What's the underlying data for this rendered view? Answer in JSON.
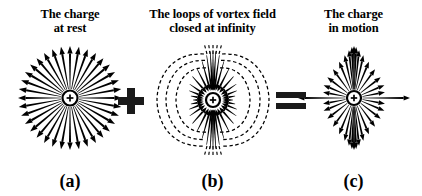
{
  "figure": {
    "background": "#ffffff",
    "ink": "#000000",
    "caption_equation": "(a) + (b) = (c)"
  },
  "panels": [
    {
      "id": "a",
      "label": "(a)",
      "title_line1": "The charge",
      "title_line2": "at rest",
      "charge_symbol": "+",
      "field": {
        "type": "radial-arrows",
        "ray_count": 36,
        "inner_radius": 9,
        "outer_radius": 52,
        "arrow_direction": "outward",
        "line_style": "solid",
        "color": "#000000"
      }
    },
    {
      "id": "b",
      "label": "(b)",
      "title_line1": "The loops of vortex field",
      "title_line2": "closed at infinity",
      "charge_symbol": "+",
      "field": {
        "type": "vortex-loops",
        "solid_ray_count": 36,
        "arrow_direction": "inward",
        "loop_style": "dashed",
        "dashed_loop_count": 6,
        "color": "#000000"
      }
    },
    {
      "id": "c",
      "label": "(c)",
      "title_line1": "The charge",
      "title_line2": "in motion",
      "charge_symbol": "+",
      "field": {
        "type": "compressed-radial-arrows",
        "ray_count": 36,
        "compression_axis": "horizontal",
        "dense_region": "vertical",
        "arrow_direction": "outward",
        "line_style": "solid",
        "color": "#000000"
      }
    }
  ],
  "operators": [
    {
      "id": "plus",
      "symbol": "+",
      "between": "a-and-b"
    },
    {
      "id": "equals",
      "symbol": "=",
      "between": "b-and-c"
    }
  ]
}
